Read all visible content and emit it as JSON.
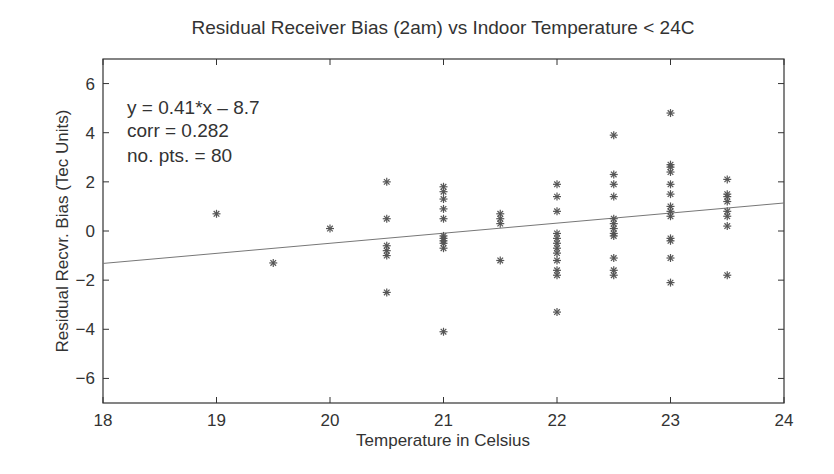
{
  "chart_data": {
    "type": "scatter",
    "title": "Residual Receiver Bias (2am) vs Indoor Temperature < 24C",
    "xlabel": "Temperature in Celsius",
    "ylabel": "Residual Recvr. Bias (Tec Units)",
    "xlim": [
      18,
      24
    ],
    "ylim": [
      -7,
      7
    ],
    "xticks": [
      18,
      19,
      20,
      21,
      22,
      23,
      24
    ],
    "yticks": [
      -6,
      -4,
      -2,
      0,
      2,
      4,
      6
    ],
    "grid": false,
    "legend": null,
    "marker": "asterisk",
    "annotations": [
      "y = 0.41*x – 8.7",
      "corr = 0.282",
      "no. pts. = 80"
    ],
    "fit_line": {
      "slope": 0.41,
      "intercept": -8.7,
      "x_range": [
        18,
        24
      ]
    },
    "series": [
      {
        "name": "Residual receiver bias",
        "points": [
          [
            19,
            0.7
          ],
          [
            19.5,
            -1.3
          ],
          [
            20,
            0.1
          ],
          [
            20.5,
            2.0
          ],
          [
            20.5,
            0.5
          ],
          [
            20.5,
            -0.6
          ],
          [
            20.5,
            -0.8
          ],
          [
            20.5,
            -1.0
          ],
          [
            20.5,
            -2.5
          ],
          [
            21,
            1.8
          ],
          [
            21,
            1.6
          ],
          [
            21,
            1.3
          ],
          [
            21,
            0.9
          ],
          [
            21,
            0.5
          ],
          [
            21,
            -0.2
          ],
          [
            21,
            -0.3
          ],
          [
            21,
            -0.4
          ],
          [
            21,
            -0.5
          ],
          [
            21,
            -0.7
          ],
          [
            21,
            -4.1
          ],
          [
            21.5,
            0.7
          ],
          [
            21.5,
            0.5
          ],
          [
            21.5,
            0.3
          ],
          [
            21.5,
            -1.2
          ],
          [
            22,
            1.9
          ],
          [
            22,
            1.4
          ],
          [
            22,
            0.8
          ],
          [
            22,
            -0.1
          ],
          [
            22,
            -0.3
          ],
          [
            22,
            -0.5
          ],
          [
            22,
            -0.7
          ],
          [
            22,
            -0.9
          ],
          [
            22,
            -1.2
          ],
          [
            22,
            -1.6
          ],
          [
            22,
            -1.8
          ],
          [
            22,
            -3.3
          ],
          [
            22.5,
            3.9
          ],
          [
            22.5,
            2.3
          ],
          [
            22.5,
            1.9
          ],
          [
            22.5,
            1.4
          ],
          [
            22.5,
            0.5
          ],
          [
            22.5,
            0.3
          ],
          [
            22.5,
            0.1
          ],
          [
            22.5,
            -0.1
          ],
          [
            22.5,
            -0.2
          ],
          [
            22.5,
            -1.1
          ],
          [
            22.5,
            -1.6
          ],
          [
            22.5,
            -1.8
          ],
          [
            23,
            4.8
          ],
          [
            23,
            2.7
          ],
          [
            23,
            2.6
          ],
          [
            23,
            2.4
          ],
          [
            23,
            1.9
          ],
          [
            23,
            1.5
          ],
          [
            23,
            1.0
          ],
          [
            23,
            0.8
          ],
          [
            23,
            0.6
          ],
          [
            23,
            -0.3
          ],
          [
            23,
            -0.4
          ],
          [
            23,
            -1.1
          ],
          [
            23,
            -2.1
          ],
          [
            23.5,
            2.1
          ],
          [
            23.5,
            1.5
          ],
          [
            23.5,
            1.4
          ],
          [
            23.5,
            1.2
          ],
          [
            23.5,
            0.8
          ],
          [
            23.5,
            0.6
          ],
          [
            23.5,
            0.2
          ],
          [
            23.5,
            -1.8
          ]
        ]
      }
    ]
  },
  "colors": {
    "axis": "#333333",
    "marker": "#555555",
    "fit_line": "#777777",
    "text": "#333333"
  }
}
